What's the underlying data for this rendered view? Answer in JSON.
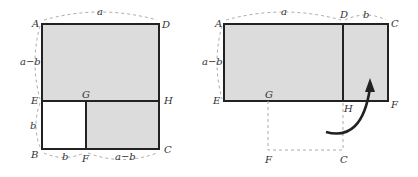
{
  "figure_left": {
    "points": {
      "A": "A",
      "D": "D",
      "E": "E",
      "G": "G",
      "H": "H",
      "B": "B",
      "F": "F",
      "C": "C"
    },
    "dims": {
      "top": "a",
      "left_upper": "a−b",
      "left_lower": "b",
      "bottom_left": "b",
      "bottom_right": "a−b"
    }
  },
  "figure_right": {
    "points": {
      "A": "A",
      "D": "D",
      "C": "C",
      "E": "E",
      "G": "G",
      "H": "H",
      "F": "F",
      "F2": "F",
      "C2": "C"
    },
    "dims": {
      "top_left": "a",
      "top_right": "b",
      "left": "a−b"
    },
    "arrow": "rotate-arrow"
  },
  "colors": {
    "fill": "#dcdcdc",
    "edge": "#222222",
    "dash": "#aaaaaa"
  }
}
